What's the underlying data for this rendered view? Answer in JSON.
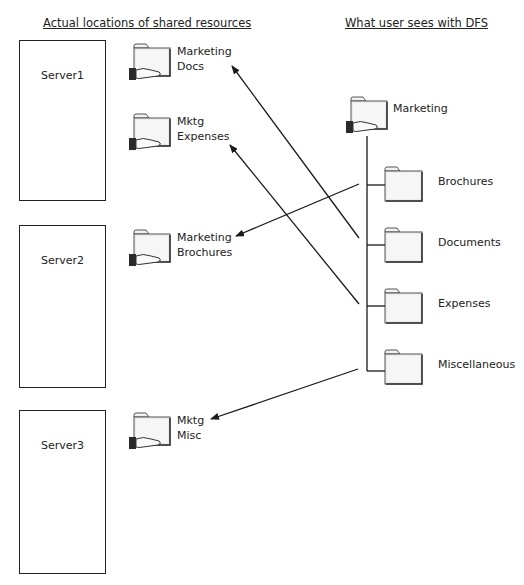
{
  "headings": {
    "left": "Actual locations of shared resources",
    "right": "What user sees with DFS"
  },
  "servers": [
    {
      "label": "Server1"
    },
    {
      "label": "Server2"
    },
    {
      "label": "Server3"
    }
  ],
  "shares": [
    {
      "line1": "Marketing",
      "line2": "Docs",
      "icon": "shared-folder-icon"
    },
    {
      "line1": "Mktg",
      "line2": "Expenses",
      "icon": "shared-folder-icon"
    },
    {
      "line1": "Marketing",
      "line2": "Brochures",
      "icon": "shared-folder-icon"
    },
    {
      "line1": "Mktg",
      "line2": "Misc",
      "icon": "shared-folder-icon"
    }
  ],
  "dfs": {
    "root": {
      "label": "Marketing",
      "icon": "shared-folder-icon"
    },
    "children": [
      {
        "label": "Brochures",
        "icon": "folder-icon",
        "maps_to": "Marketing Brochures"
      },
      {
        "label": "Documents",
        "icon": "folder-icon",
        "maps_to": "Marketing Docs"
      },
      {
        "label": "Expenses",
        "icon": "folder-icon",
        "maps_to": "Mktg Expenses"
      },
      {
        "label": "Miscellaneous",
        "icon": "folder-icon",
        "maps_to": "Mktg Misc"
      }
    ]
  },
  "colors": {
    "line": "#1a1a1a",
    "folder_fill": "#eeeeee",
    "folder_stroke": "#555555",
    "hand": "#333333"
  }
}
